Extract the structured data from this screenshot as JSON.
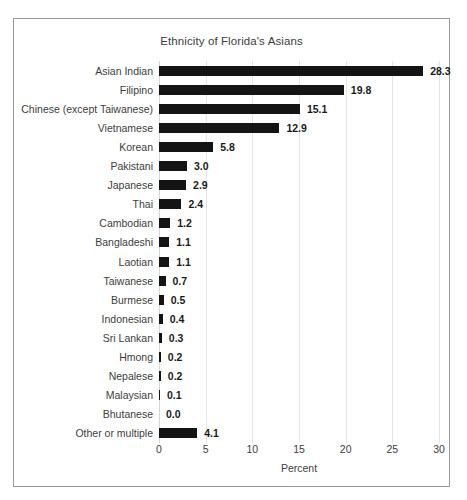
{
  "chart_data": {
    "type": "bar",
    "orientation": "horizontal",
    "title": "Ethnicity of Florida's Asians",
    "xlabel": "Percent",
    "ylabel": "",
    "xlim": [
      0,
      30
    ],
    "xticks": [
      0,
      5,
      10,
      15,
      20,
      25,
      30
    ],
    "xtick_labels": [
      "0",
      "5",
      "10",
      "15",
      "20",
      "25",
      "30"
    ],
    "grid": "vertical",
    "legend": "none",
    "bar_color": "#141414",
    "categories": [
      "Asian Indian",
      "Filipino",
      "Chinese (except Taiwanese)",
      "Vietnamese",
      "Korean",
      "Pakistani",
      "Japanese",
      "Thai",
      "Cambodian",
      "Bangladeshi",
      "Laotian",
      "Taiwanese",
      "Burmese",
      "Indonesian",
      "Sri Lankan",
      "Hmong",
      "Nepalese",
      "Malaysian",
      "Bhutanese",
      "Other or multiple"
    ],
    "values": [
      28.3,
      19.8,
      15.1,
      12.9,
      5.8,
      3.0,
      2.9,
      2.4,
      1.2,
      1.1,
      1.1,
      0.7,
      0.5,
      0.4,
      0.3,
      0.2,
      0.2,
      0.1,
      0.0,
      4.1
    ],
    "value_labels": [
      "28.3",
      "19.8",
      "15.1",
      "12.9",
      "5.8",
      "3.0",
      "2.9",
      "2.4",
      "1.2",
      "1.1",
      "1.1",
      "0.7",
      "0.5",
      "0.4",
      "0.3",
      "0.2",
      "0.2",
      "0.1",
      "0.0",
      "4.1"
    ]
  }
}
